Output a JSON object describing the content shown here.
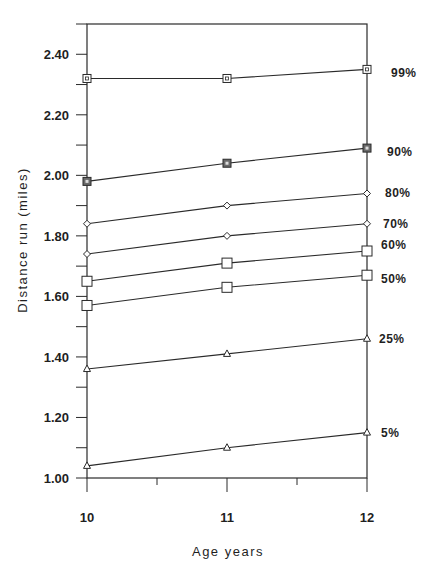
{
  "chart_data": {
    "type": "line",
    "title": "",
    "xlabel": "Age years",
    "ylabel": "Distance run (miles)",
    "x": [
      10,
      11,
      12
    ],
    "x_tick_labels": [
      "10",
      "11",
      "12"
    ],
    "y_tick_labels": [
      "1.00",
      "1.20",
      "1.40",
      "1.60",
      "1.80",
      "2.00",
      "2.20",
      "2.40"
    ],
    "y_ticks": [
      1.0,
      1.2,
      1.4,
      1.6,
      1.8,
      2.0,
      2.2,
      2.4
    ],
    "xlim": [
      10,
      12
    ],
    "ylim": [
      1.0,
      2.5
    ],
    "grid": false,
    "legend_position": "right (direct labels at series end)",
    "series": [
      {
        "name": "99%",
        "marker": "square-dot",
        "values": [
          2.32,
          2.32,
          2.35
        ]
      },
      {
        "name": "90%",
        "marker": "square-filled",
        "values": [
          1.98,
          2.04,
          2.09
        ]
      },
      {
        "name": "80%",
        "marker": "diamond",
        "values": [
          1.84,
          1.9,
          1.94
        ]
      },
      {
        "name": "70%",
        "marker": "diamond",
        "values": [
          1.74,
          1.8,
          1.84
        ]
      },
      {
        "name": "60%",
        "marker": "square",
        "values": [
          1.65,
          1.71,
          1.75
        ]
      },
      {
        "name": "50%",
        "marker": "square",
        "values": [
          1.57,
          1.63,
          1.67
        ]
      },
      {
        "name": "25%",
        "marker": "triangle",
        "values": [
          1.36,
          1.41,
          1.46
        ]
      },
      {
        "name": "5%",
        "marker": "triangle",
        "values": [
          1.04,
          1.1,
          1.15
        ]
      }
    ]
  },
  "colors": {
    "line": "#2a2a2a",
    "text": "#1f1f1f",
    "background": "#ffffff"
  }
}
